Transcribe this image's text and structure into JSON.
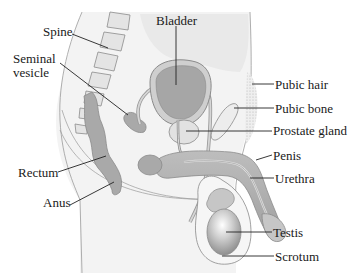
{
  "diagram": {
    "colors": {
      "background": "#ffffff",
      "body_fill": "#f1f1f1",
      "pelvis_fill": "#e6e6e6",
      "organ_dark": "#a6a6a6",
      "organ_mid": "#c4c4c4",
      "outline": "#8c8c8c",
      "leader_line": "#222222",
      "label_text": "#1a1a1a"
    },
    "labels": {
      "spine": "Spine",
      "seminal_vesicle": "Seminal\nvesicle",
      "bladder": "Bladder",
      "pubic_hair": "Pubic hair",
      "pubic_bone": "Pubic bone",
      "prostate_gland": "Prostate gland",
      "penis": "Penis",
      "urethra": "Urethra",
      "rectum": "Rectum",
      "anus": "Anus",
      "testis": "Testis",
      "scrotum": "Scrotum"
    }
  }
}
